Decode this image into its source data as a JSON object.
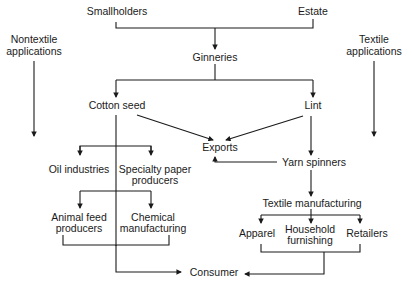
{
  "diagram": {
    "nodes": {
      "smallholders": "Smallholders",
      "estate": "Estate",
      "ginneries": "Ginneries",
      "cotton_seed": "Cotton seed",
      "lint": "Lint",
      "exports": "Exports",
      "yarn_spinners": "Yarn spinners",
      "oil_industries": "Oil industries",
      "specialty_paper_1": "Specialty paper",
      "specialty_paper_2": "producers",
      "animal_feed_1": "Animal feed",
      "animal_feed_2": "producers",
      "chemical_1": "Chemical",
      "chemical_2": "manufacturing",
      "textile_manufacturing": "Textile manufacturing",
      "apparel": "Apparel",
      "household_1": "Household",
      "household_2": "furnishing",
      "retailers": "Retailers",
      "consumer": "Consumer",
      "nontextile_1": "Nontextile",
      "nontextile_2": "applications",
      "textile_app_1": "Textile",
      "textile_app_2": "applications"
    },
    "edges": [
      [
        "Smallholders",
        "Ginneries"
      ],
      [
        "Estate",
        "Ginneries"
      ],
      [
        "Ginneries",
        "Cotton seed"
      ],
      [
        "Ginneries",
        "Lint"
      ],
      [
        "Cotton seed",
        "Exports"
      ],
      [
        "Lint",
        "Exports"
      ],
      [
        "Lint",
        "Yarn spinners"
      ],
      [
        "Yarn spinners",
        "Exports"
      ],
      [
        "Cotton seed",
        "Oil industries"
      ],
      [
        "Cotton seed",
        "Specialty paper producers"
      ],
      [
        "Cotton seed",
        "Animal feed producers"
      ],
      [
        "Cotton seed",
        "Chemical manufacturing"
      ],
      [
        "Yarn spinners",
        "Textile manufacturing"
      ],
      [
        "Textile manufacturing",
        "Apparel"
      ],
      [
        "Textile manufacturing",
        "Household furnishing"
      ],
      [
        "Textile manufacturing",
        "Retailers"
      ],
      [
        "Animal feed producers + Chemical manufacturing",
        "Consumer"
      ],
      [
        "Apparel + Household furnishing + Retailers",
        "Consumer"
      ]
    ],
    "line_color": "#1a1a1a"
  }
}
